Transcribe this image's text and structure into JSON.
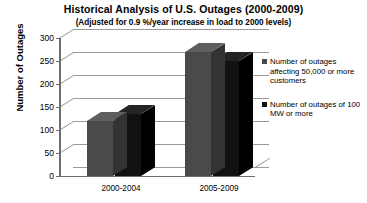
{
  "chart_data": {
    "type": "bar",
    "title": "Historical Analysis of U.S. Outages (2000-2009)",
    "subtitle": "(Adjusted for 0.9 %/year increase in load to 2000 levels)",
    "xlabel": "",
    "ylabel": "Number of Outages",
    "ylim": [
      0,
      300
    ],
    "yticks": [
      "300",
      "250",
      "200",
      "150",
      "100",
      "50",
      "0"
    ],
    "grid": true,
    "legend_position": "right",
    "categories": [
      "2000-2004",
      "2005-2009"
    ],
    "series": [
      {
        "name": "Number of outages affecting 50,000 or more customers",
        "color": "#4a4a4a",
        "values": [
          120,
          270
        ]
      },
      {
        "name": "Number of outages of 100 MW or more",
        "color": "#111111",
        "values": [
          135,
          250
        ]
      }
    ]
  },
  "legend": {
    "entries": [
      {
        "label": "Number of outages affecting 50,000 or more customers"
      },
      {
        "label": "Number of outages of 100 MW or more"
      }
    ]
  }
}
